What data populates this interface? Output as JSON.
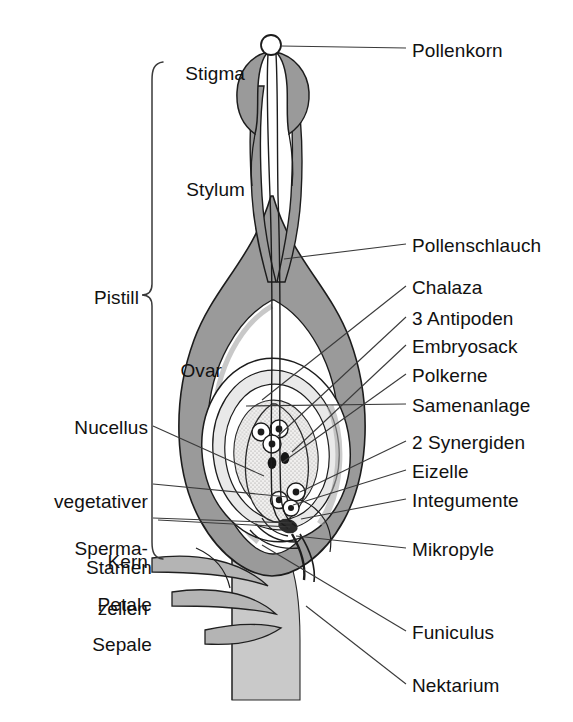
{
  "figure": {
    "language": "de",
    "width": 573,
    "height": 722,
    "colors": {
      "background": "#ffffff",
      "tissue_fill": "#9a9a9a",
      "tissue_light": "#c9c9c9",
      "inner_fill": "#e8e8e8",
      "outline": "#1a1a1a",
      "leader_line": "#3a3a3a",
      "text": "#111111"
    }
  },
  "labels": {
    "right": [
      {
        "id": "pollenkorn",
        "text": "Pollenkorn",
        "x": 412,
        "y": 55,
        "anchor_x": 268,
        "anchor_y": 46
      },
      {
        "id": "pollenschlauch",
        "text": "Pollenschlauch",
        "x": 412,
        "y": 250,
        "anchor_x": 283,
        "anchor_y": 259
      },
      {
        "id": "chalaza",
        "text": "Chalaza",
        "x": 412,
        "y": 292,
        "anchor_x": 262,
        "anchor_y": 400
      },
      {
        "id": "antipoden",
        "text": "3 Antipoden",
        "x": 412,
        "y": 323,
        "anchor_x": 276,
        "anchor_y": 437
      },
      {
        "id": "embryosack",
        "text": "Embryosack",
        "x": 412,
        "y": 351,
        "anchor_x": 290,
        "anchor_y": 452
      },
      {
        "id": "polkerne",
        "text": "Polkerne",
        "x": 412,
        "y": 380,
        "anchor_x": 281,
        "anchor_y": 462
      },
      {
        "id": "samenanlage",
        "text": "Samenanlage",
        "x": 412,
        "y": 410,
        "anchor_x": 248,
        "anchor_y": 408
      },
      {
        "id": "synergiden",
        "text": "2 Synergiden",
        "x": 412,
        "y": 447,
        "anchor_x": 299,
        "anchor_y": 492
      },
      {
        "id": "eizelle",
        "text": "Eizelle",
        "x": 412,
        "y": 476,
        "anchor_x": 292,
        "anchor_y": 505
      },
      {
        "id": "integumente",
        "text": "Integumente",
        "x": 412,
        "y": 505,
        "anchor_x": 300,
        "anchor_y": 519
      },
      {
        "id": "mikropyle",
        "text": "Mikropyle",
        "x": 412,
        "y": 554,
        "anchor_x": 300,
        "anchor_y": 534
      },
      {
        "id": "funiculus",
        "text": "Funiculus",
        "x": 412,
        "y": 637,
        "anchor_x": 263,
        "anchor_y": 545
      },
      {
        "id": "nektarium",
        "text": "Nektarium",
        "x": 412,
        "y": 690,
        "anchor_x": 306,
        "anchor_y": 609
      }
    ],
    "left": [
      {
        "id": "stigma",
        "text": "Stigma",
        "x": 245,
        "y": 78,
        "align": "right"
      },
      {
        "id": "stylum",
        "text": "Stylum",
        "x": 245,
        "y": 194,
        "align": "right"
      },
      {
        "id": "pistill",
        "text": "Pistill",
        "x": 139,
        "y": 302,
        "align": "right"
      },
      {
        "id": "ovar",
        "text": "Ovar",
        "x": 222,
        "y": 375,
        "align": "right"
      },
      {
        "id": "nucellus",
        "text": "Nucellus",
        "x": 148,
        "y": 432,
        "align": "right",
        "anchor_x": 262,
        "anchor_y": 475
      },
      {
        "id": "stamen",
        "text": "Stamen",
        "x": 152,
        "y": 572,
        "align": "right"
      },
      {
        "id": "petale",
        "text": "Petale",
        "x": 152,
        "y": 609,
        "align": "right"
      },
      {
        "id": "sepale",
        "text": "Sepale",
        "x": 152,
        "y": 649,
        "align": "right"
      }
    ],
    "left_multiline": [
      {
        "id": "vegetativer-kern",
        "lines": [
          "vegetativer",
          "Kern"
        ],
        "x": 148,
        "y": 466,
        "align": "right",
        "anchor_x": 286,
        "anchor_y": 496
      },
      {
        "id": "spermazellen",
        "lines": [
          "Sperma-",
          "zellen"
        ],
        "x": 148,
        "y": 513,
        "align": "right",
        "anchor_x": 292,
        "anchor_y": 522
      }
    ]
  },
  "braces": {
    "pistill": {
      "top": 62,
      "bottom": 556,
      "tip_y": 295,
      "x": 152
    }
  },
  "structures": [
    {
      "id": "pollen-grain",
      "name": "Pollenkorn",
      "shape": "circle"
    },
    {
      "id": "stigma-head",
      "name": "Stigma",
      "shape": "bulb"
    },
    {
      "id": "style-column",
      "name": "Stylum",
      "shape": "column"
    },
    {
      "id": "pollen-tube",
      "name": "Pollenschlauch",
      "shape": "channel"
    },
    {
      "id": "ovary-wall",
      "name": "Ovar",
      "shape": "ovoid"
    },
    {
      "id": "ovule",
      "name": "Samenanlage",
      "shape": "ellipse"
    },
    {
      "id": "integuments",
      "name": "Integumente",
      "shape": "nested-ellipses"
    },
    {
      "id": "nucellus",
      "name": "Nucellus",
      "shape": "ellipse"
    },
    {
      "id": "embryo-sac",
      "name": "Embryosack",
      "shape": "ellipse"
    },
    {
      "id": "antipodal-cells",
      "name": "3 Antipoden",
      "count": 3
    },
    {
      "id": "polar-nuclei",
      "name": "Polkerne",
      "count": 2
    },
    {
      "id": "synergids",
      "name": "2 Synergiden",
      "count": 2
    },
    {
      "id": "egg-cell",
      "name": "Eizelle",
      "count": 1
    },
    {
      "id": "micropyle",
      "name": "Mikropyle",
      "shape": "opening"
    },
    {
      "id": "funiculus",
      "name": "Funiculus",
      "shape": "stalk"
    },
    {
      "id": "chalaza",
      "name": "Chalaza",
      "shape": "region"
    },
    {
      "id": "stamen",
      "name": "Stamen",
      "shape": "curved-appendage"
    },
    {
      "id": "petal",
      "name": "Petale",
      "shape": "curved-appendage"
    },
    {
      "id": "sepal",
      "name": "Sepale",
      "shape": "curved-appendage"
    },
    {
      "id": "nectary",
      "name": "Nektarium",
      "shape": "receptacle"
    }
  ]
}
